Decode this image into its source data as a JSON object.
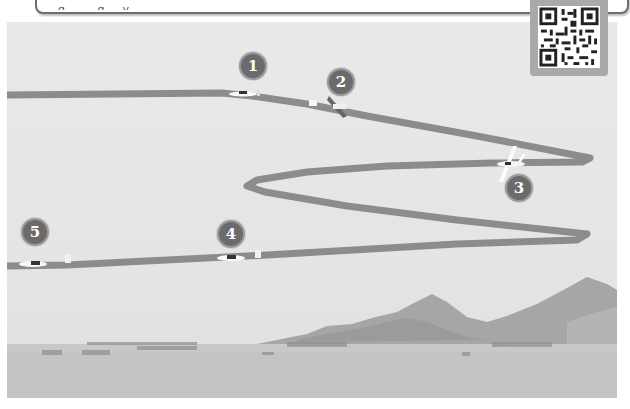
{
  "caption": {
    "text": "…g … … g … y …"
  },
  "qr_code": {
    "label": "qr-code"
  },
  "flight_path": {
    "color": "#8c8c8c",
    "markers": [
      {
        "label": "1",
        "x": 232,
        "y": 52
      },
      {
        "label": "2",
        "x": 327,
        "y": 68
      },
      {
        "label": "3",
        "x": 504,
        "y": 176
      },
      {
        "label": "4",
        "x": 217,
        "y": 222
      },
      {
        "label": "5",
        "x": 19,
        "y": 219
      }
    ]
  },
  "colors": {
    "sky": "#e7e7e7",
    "path": "#8c8c8c",
    "marker_fill": "#6b6b6b",
    "mountain": "#a3a3a3",
    "ground": "#c9c9c9"
  }
}
